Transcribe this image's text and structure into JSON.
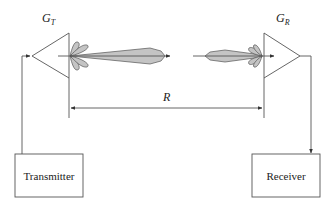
{
  "diagram": {
    "labels": {
      "transmit_gain": "G",
      "transmit_gain_sub": "T",
      "receive_gain": "G",
      "receive_gain_sub": "R",
      "range": "R",
      "transmitter": "Transmitter",
      "receiver": "Receiver"
    },
    "nodes": [
      {
        "id": "transmitter",
        "label": "Transmitter",
        "shape": "rectangle"
      },
      {
        "id": "tx-antenna",
        "label": "G_T",
        "shape": "triangle"
      },
      {
        "id": "rx-antenna",
        "label": "G_R",
        "shape": "triangle"
      },
      {
        "id": "receiver",
        "label": "Receiver",
        "shape": "rectangle"
      }
    ],
    "edges": [
      {
        "from": "transmitter",
        "to": "tx-antenna",
        "kind": "feed-line"
      },
      {
        "from": "tx-antenna",
        "to": "rx-antenna",
        "kind": "radiated-beam"
      },
      {
        "from": "rx-antenna",
        "to": "receiver",
        "kind": "feed-line"
      }
    ],
    "dimension": {
      "label": "R",
      "between": [
        "tx-antenna",
        "rx-antenna"
      ]
    },
    "colors": {
      "line": "#555555",
      "lobe_fill": "#c4c4c4",
      "text": "#222222",
      "background": "#ffffff"
    }
  }
}
